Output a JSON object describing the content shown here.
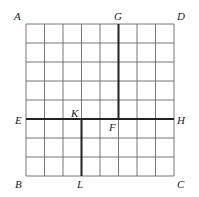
{
  "diagram": {
    "grid": {
      "rows": 8,
      "cols": 8,
      "x0": 26,
      "y0": 24,
      "x1": 174,
      "y1": 176
    },
    "labels": {
      "A": "A",
      "B": "B",
      "C": "C",
      "D": "D",
      "E": "E",
      "F": "F",
      "G": "G",
      "H": "H",
      "K": "K",
      "L": "L"
    },
    "segments": [
      {
        "name": "GF",
        "from": "G",
        "to": "F",
        "col": 5
      },
      {
        "name": "EH",
        "from": "E",
        "to": "H",
        "row": 5
      },
      {
        "name": "KL",
        "from": "K",
        "to": "L",
        "col": 3
      }
    ],
    "colors": {
      "grid": "#555555",
      "bold": "#222222",
      "text": "#222222"
    }
  }
}
